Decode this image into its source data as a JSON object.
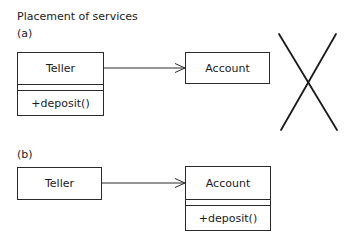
{
  "title": "Placement of services",
  "panels": [
    {
      "label": "(a)",
      "source_class": {
        "name": "Teller",
        "attributes": "",
        "operations": "+deposit()"
      },
      "target_class": {
        "name": "Account"
      },
      "association": "navigable",
      "crossed_out": true
    },
    {
      "label": "(b)",
      "source_class": {
        "name": "Teller"
      },
      "target_class": {
        "name": "Account",
        "attributes": "",
        "operations": "+deposit()"
      },
      "association": "navigable",
      "crossed_out": false
    }
  ],
  "colors": {
    "line": "#2a2a2a",
    "cross": "#1a1a1a",
    "background": "#ffffff"
  }
}
